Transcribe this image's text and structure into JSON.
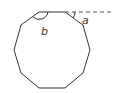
{
  "diagram": {
    "shape": "regular decagon",
    "labels": {
      "interior_angle": "b",
      "exterior_angle": "a"
    },
    "colors": {
      "stroke": "#333333",
      "dashed": "#555555"
    }
  }
}
